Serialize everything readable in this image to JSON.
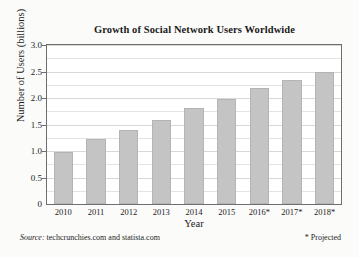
{
  "chart_data": {
    "type": "bar",
    "title": "Growth of Social Network Users Worldwide",
    "xlabel": "Year",
    "ylabel": "Number of Users (billions)",
    "categories": [
      "2010",
      "2011",
      "2012",
      "2013",
      "2014",
      "2015",
      "2016*",
      "2017*",
      "2018*"
    ],
    "values": [
      0.99,
      1.22,
      1.4,
      1.59,
      1.81,
      1.98,
      2.19,
      2.34,
      2.5
    ],
    "ylim": [
      0,
      3.0
    ],
    "ytick_labels": [
      "0",
      "0.5",
      "1.0",
      "1.5",
      "2.0",
      "2.5",
      "3.0"
    ],
    "ytick_values": [
      0,
      0.5,
      1.0,
      1.5,
      2.0,
      2.5,
      3.0
    ],
    "minor_gridline_step": 0.25,
    "grid": true,
    "legend": false,
    "bar_color": "#c4c4c4",
    "bar_edge_color": "#b4b4b4",
    "frame_color": "#6e6e6e",
    "background_color": "#ffffff"
  },
  "footer": {
    "source_label": "Source:",
    "source_text": "techcrunchies.com and statista.com",
    "projected_note": "* Projected"
  }
}
